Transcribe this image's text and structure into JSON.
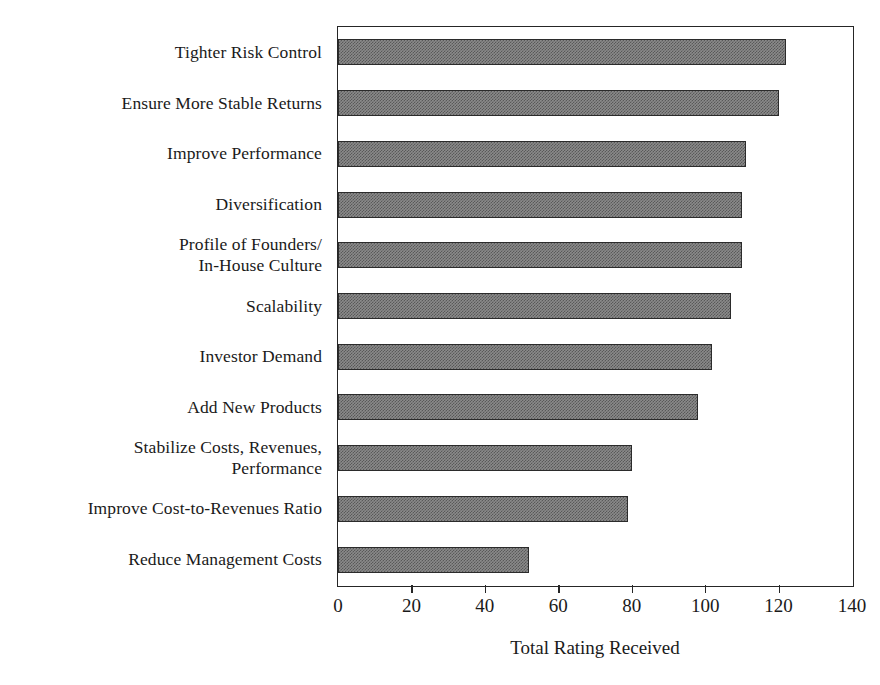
{
  "chart_data": {
    "type": "bar",
    "orientation": "horizontal",
    "title": "",
    "xlabel": "Total Rating Received",
    "ylabel": "",
    "xlim": [
      0,
      140
    ],
    "xticks": [
      0,
      20,
      40,
      60,
      80,
      100,
      120,
      140
    ],
    "xtick_labels": [
      "0",
      "20",
      "40",
      "60",
      "80",
      "100",
      "120",
      "140"
    ],
    "grid": false,
    "legend": false,
    "bar_color": "#8a8a8a",
    "bar_edge_color": "#2b2b2b",
    "categories": [
      "Tighter Risk Control",
      "Ensure More Stable Returns",
      "Improve Performance",
      "Diversification",
      "Profile of Founders/\nIn-House Culture",
      "Scalability",
      "Investor Demand",
      "Add New Products",
      "Stabilize Costs, Revenues,\nPerformance",
      "Improve Cost-to-Revenues Ratio",
      "Reduce Management Costs"
    ],
    "values": [
      122,
      120,
      111,
      110,
      110,
      107,
      102,
      98,
      80,
      79,
      52
    ]
  }
}
